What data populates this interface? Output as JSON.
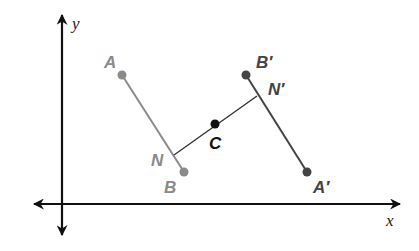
{
  "diagram": {
    "type": "coordinate-plane-reflection",
    "axes": {
      "x_label": "x",
      "y_label": "y",
      "origin_px": [
        62,
        204
      ],
      "color": "#111111"
    },
    "segments": [
      {
        "name": "AB",
        "from": "A",
        "to": "B",
        "color": "#8a8a8a"
      },
      {
        "name": "A'B'",
        "from": "A'",
        "to": "B'",
        "color": "#444444"
      },
      {
        "name": "NN'",
        "from": "N",
        "to": "N'",
        "color": "#333333"
      }
    ],
    "points": {
      "A": {
        "label": "A",
        "px": [
          122,
          75
        ],
        "label_px": [
          104,
          68
        ],
        "color": "#8a8a8a"
      },
      "B": {
        "label": "B",
        "px": [
          184,
          172
        ],
        "label_px": [
          164,
          193
        ],
        "color": "#8a8a8a"
      },
      "N": {
        "label": "N",
        "px": [
          174,
          155
        ],
        "label_px": [
          151,
          166
        ],
        "color": "#8a8a8a"
      },
      "C": {
        "label": "C",
        "px": [
          215,
          124
        ],
        "label_px": [
          209,
          149
        ],
        "color": "#111111"
      },
      "B'": {
        "label": "B′",
        "px": [
          246,
          75
        ],
        "label_px": [
          256,
          68
        ],
        "color": "#444444"
      },
      "N'": {
        "label": "N′",
        "px": [
          257,
          96
        ],
        "label_px": [
          268,
          95
        ],
        "color": "#444444"
      },
      "A'": {
        "label": "A′",
        "px": [
          307,
          172
        ],
        "label_px": [
          313,
          193
        ],
        "color": "#444444"
      }
    }
  }
}
